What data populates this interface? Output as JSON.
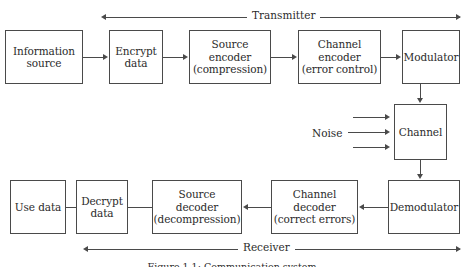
{
  "diagram": {
    "stroke_color": "#4a4a4a",
    "text_color": "#2b2b2b",
    "background_color": "#ffffff",
    "sections": {
      "transmitter_label": "Transmitter",
      "receiver_label": "Receiver",
      "noise_label": "Noise"
    },
    "nodes": {
      "information_source": {
        "line1": "Information",
        "line2": "source"
      },
      "encrypt_data": {
        "line1": "Encrypt",
        "line2": "data"
      },
      "source_encoder": {
        "line1": "Source",
        "line2": "encoder",
        "line3": "(compression)"
      },
      "channel_encoder": {
        "line1": "Channel",
        "line2": "encoder",
        "line3": "(error control)"
      },
      "modulator": {
        "line1": "Modulator"
      },
      "channel": {
        "line1": "Channel"
      },
      "demodulator": {
        "line1": "Demodulator"
      },
      "channel_decoder": {
        "line1": "Channel",
        "line2": "decoder",
        "line3": "(correct errors)"
      },
      "source_decoder": {
        "line1": "Source",
        "line2": "decoder",
        "line3": "(decompression)"
      },
      "decrypt_data": {
        "line1": "Decrypt",
        "line2": "data"
      },
      "use_data": {
        "line1": "Use data"
      }
    },
    "caption": "Figure 1.1: Communication system"
  }
}
